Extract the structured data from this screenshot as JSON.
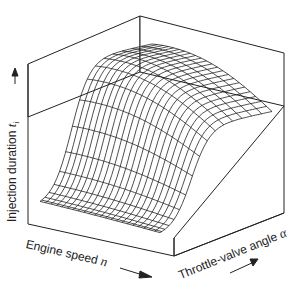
{
  "figure": {
    "type": "3d-surface-wireframe",
    "y_axis": {
      "label": "Injection duration",
      "symbol": "t",
      "subscript": "i"
    },
    "x_axis": {
      "label": "Engine speed",
      "symbol": "n"
    },
    "z_axis": {
      "label": "Throttle-valve angle",
      "symbol": "α"
    },
    "caption": "Figure ... Map of injection duration (cut off)",
    "colors": {
      "line": "#222222",
      "background": "#ffffff"
    }
  }
}
